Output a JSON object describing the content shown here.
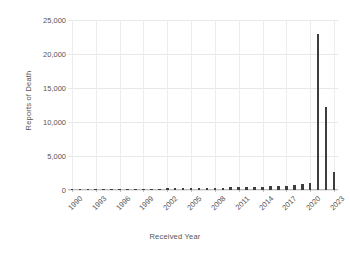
{
  "chart_data": {
    "type": "bar",
    "title": "",
    "xlabel": "Received Year",
    "ylabel": "Reports of Death",
    "ylim": [
      0,
      25000
    ],
    "yticks": [
      0,
      5000,
      10000,
      15000,
      20000,
      25000
    ],
    "ytick_labels": [
      "0",
      "5,000",
      "10,000",
      "15,000",
      "20,000",
      "25,000"
    ],
    "xtick_labels": [
      "1990",
      "1993",
      "1996",
      "1999",
      "2002",
      "2005",
      "2008",
      "2011",
      "2014",
      "2017",
      "2020",
      "2023"
    ],
    "grid": true,
    "legend": false,
    "bar_color": "#3d3d3d",
    "categories": [
      "1990",
      "1991",
      "1992",
      "1993",
      "1994",
      "1995",
      "1996",
      "1997",
      "1998",
      "1999",
      "2000",
      "2001",
      "2002",
      "2003",
      "2004",
      "2005",
      "2006",
      "2007",
      "2008",
      "2009",
      "2010",
      "2011",
      "2012",
      "2013",
      "2014",
      "2015",
      "2016",
      "2017",
      "2018",
      "2019",
      "2020",
      "2021",
      "2022",
      "2023"
    ],
    "values": [
      120,
      130,
      140,
      135,
      130,
      140,
      150,
      160,
      170,
      180,
      200,
      210,
      230,
      240,
      250,
      270,
      290,
      310,
      330,
      360,
      380,
      400,
      430,
      450,
      480,
      520,
      560,
      620,
      700,
      820,
      980,
      22900,
      12200,
      2600
    ]
  }
}
